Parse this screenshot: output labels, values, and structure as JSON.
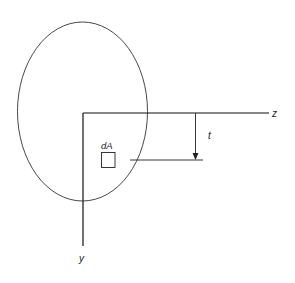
{
  "diagram": {
    "labels": {
      "z_axis": "z",
      "y_axis": "y",
      "area_element": "dA",
      "distance": "t"
    },
    "colors": {
      "stroke": "#222222",
      "background": "#ffffff"
    }
  }
}
